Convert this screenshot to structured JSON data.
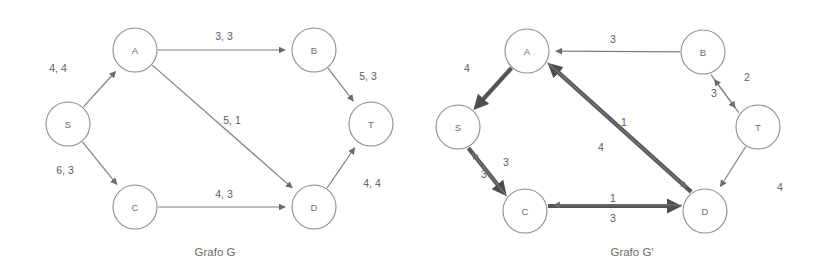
{
  "figure": {
    "background_color": "#ffffff",
    "node_stroke_color": "#8c8c8c",
    "edge_color": "#7d7d7d",
    "thick_edge_color": "#555555",
    "text_color": "#5d5d5d"
  },
  "graphs": [
    {
      "id": "graph-g",
      "caption": "Grafo G",
      "caption_x": 215,
      "caption_y": 252,
      "nodes": [
        {
          "id": "S",
          "label": "S",
          "cx": 68,
          "cy": 124,
          "r": 22
        },
        {
          "id": "A",
          "label": "A",
          "cx": 135,
          "cy": 50,
          "r": 22
        },
        {
          "id": "C",
          "label": "C",
          "cx": 135,
          "cy": 207,
          "r": 22
        },
        {
          "id": "B",
          "label": "B",
          "cx": 314,
          "cy": 50,
          "r": 22
        },
        {
          "id": "D",
          "label": "D",
          "cx": 314,
          "cy": 207,
          "r": 22
        },
        {
          "id": "T",
          "label": "T",
          "cx": 371,
          "cy": 124,
          "r": 22
        }
      ],
      "edges": [
        {
          "from": "S",
          "to": "A",
          "label": "4, 4",
          "lx": 58,
          "ly": 68,
          "weight": "thin"
        },
        {
          "from": "S",
          "to": "C",
          "label": "6, 3",
          "lx": 65,
          "ly": 170,
          "weight": "thin"
        },
        {
          "from": "A",
          "to": "B",
          "label": "3, 3",
          "lx": 224,
          "ly": 36,
          "weight": "thin"
        },
        {
          "from": "A",
          "to": "D",
          "label": "5, 1",
          "lx": 232,
          "ly": 120,
          "weight": "thin"
        },
        {
          "from": "B",
          "to": "T",
          "label": "5, 3",
          "lx": 368,
          "ly": 76,
          "weight": "thin"
        },
        {
          "from": "C",
          "to": "D",
          "label": "4, 3",
          "lx": 224,
          "ly": 194,
          "weight": "thin"
        },
        {
          "from": "D",
          "to": "T",
          "label": "4, 4",
          "lx": 372,
          "ly": 183,
          "weight": "thin"
        }
      ]
    },
    {
      "id": "graph-g-prime",
      "caption": "Grafo G'",
      "caption_x": 632,
      "caption_y": 252,
      "nodes": [
        {
          "id": "S",
          "label": "S",
          "cx": 458,
          "cy": 127,
          "r": 22
        },
        {
          "id": "A",
          "label": "A",
          "cx": 527,
          "cy": 51,
          "r": 22
        },
        {
          "id": "C",
          "label": "C",
          "cx": 525,
          "cy": 211,
          "r": 22
        },
        {
          "id": "B",
          "label": "B",
          "cx": 703,
          "cy": 52,
          "r": 22
        },
        {
          "id": "D",
          "label": "D",
          "cx": 705,
          "cy": 211,
          "r": 22
        },
        {
          "id": "T",
          "label": "T",
          "cx": 758,
          "cy": 127,
          "r": 22
        }
      ],
      "edges": [
        {
          "from": "A",
          "to": "S",
          "label": "4",
          "lx": 467,
          "ly": 68,
          "weight": "thick"
        },
        {
          "from": "B",
          "to": "A",
          "label": "3",
          "lx": 613,
          "ly": 39,
          "weight": "thin"
        },
        {
          "from": "B",
          "to": "T",
          "label": "2",
          "lx": 747,
          "ly": 77,
          "weight": "thin"
        },
        {
          "from": "T",
          "to": "B",
          "label": "3",
          "lx": 714,
          "ly": 93,
          "weight": "thin"
        },
        {
          "from": "D",
          "to": "A",
          "label": "1",
          "lx": 624,
          "ly": 122,
          "weight": "thick"
        },
        {
          "from": "A",
          "to": "D",
          "label": "4",
          "lx": 601,
          "ly": 147,
          "weight": "thin"
        },
        {
          "from": "S",
          "to": "C",
          "label": "3",
          "lx": 484,
          "ly": 174,
          "weight": "thick"
        },
        {
          "from": "C",
          "to": "S",
          "label": "3",
          "lx": 506,
          "ly": 162,
          "weight": "thin"
        },
        {
          "from": "C",
          "to": "D",
          "label": "1",
          "lx": 613,
          "ly": 198,
          "weight": "thick"
        },
        {
          "from": "D",
          "to": "C",
          "label": "3",
          "lx": 613,
          "ly": 218,
          "weight": "thin"
        },
        {
          "from": "T",
          "to": "D",
          "label": "4",
          "lx": 780,
          "ly": 187,
          "weight": "thin"
        }
      ]
    }
  ]
}
